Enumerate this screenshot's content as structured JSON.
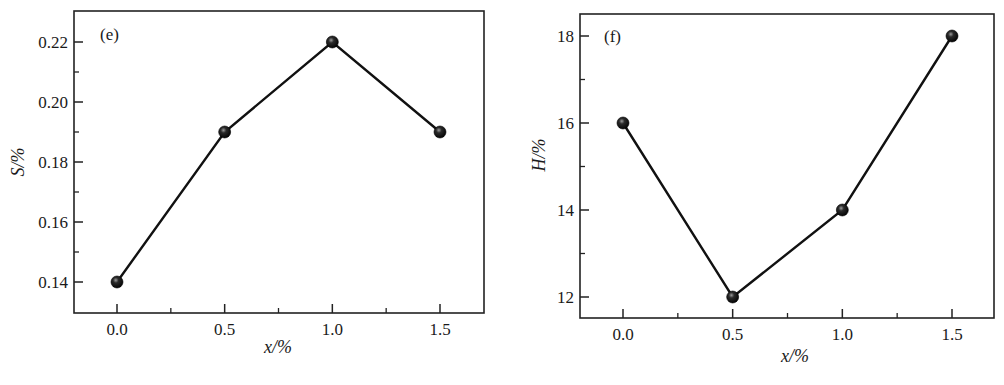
{
  "chart_data": [
    {
      "type": "line",
      "panel_label": "(e)",
      "title": "",
      "xlabel": "x/%",
      "ylabel": "S/%",
      "x": [
        0.0,
        0.5,
        1.0,
        1.5
      ],
      "series": [
        {
          "name": "S",
          "values": [
            0.14,
            0.19,
            0.22,
            0.19
          ]
        }
      ],
      "xticks": [
        "0.0",
        "0.5",
        "1.0",
        "1.5"
      ],
      "yticks": [
        "0.14",
        "0.16",
        "0.18",
        "0.20",
        "0.22"
      ],
      "xlim": [
        -0.2,
        1.72
      ],
      "ylim": [
        0.13,
        0.23
      ],
      "grid": false,
      "legend": "none",
      "marker": "filled-sphere",
      "line_color": "#111111"
    },
    {
      "type": "line",
      "panel_label": "(f)",
      "title": "",
      "xlabel": "x/%",
      "ylabel": "H/%",
      "x": [
        0.0,
        0.5,
        1.0,
        1.5
      ],
      "series": [
        {
          "name": "H",
          "values": [
            16,
            12,
            14,
            18
          ]
        }
      ],
      "xticks": [
        "0.0",
        "0.5",
        "1.0",
        "1.5"
      ],
      "yticks": [
        "12",
        "14",
        "16",
        "18"
      ],
      "xlim": [
        -0.2,
        1.72
      ],
      "ylim": [
        11.5,
        18.5
      ],
      "grid": false,
      "legend": "none",
      "marker": "filled-sphere",
      "line_color": "#111111"
    }
  ]
}
